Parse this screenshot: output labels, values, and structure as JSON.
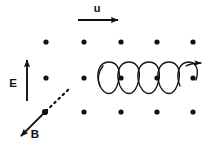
{
  "figure": {
    "background_color": "#ffffff",
    "ink_color": "#111111",
    "width": 211,
    "height": 150
  },
  "labels": {
    "velocity": "u",
    "electric_field": "E",
    "magnetic_field": "B"
  },
  "arrows": {
    "velocity": {
      "name": "u",
      "direction": "right",
      "x1": 78,
      "y1": 20,
      "x2": 121,
      "y2": 20,
      "label_x": 97,
      "label_y": 11,
      "style": "solid"
    },
    "electric_field": {
      "name": "E",
      "direction": "up",
      "x1": 27,
      "y1": 101,
      "x2": 27,
      "y2": 57,
      "label_x": 13,
      "label_y": 85,
      "style": "solid"
    },
    "magnetic_field": {
      "name": "B",
      "direction": "down-left",
      "x1": 45,
      "y1": 112,
      "x2": 19,
      "y2": 138,
      "dashed_x1": 45,
      "dashed_y1": 112,
      "dashed_x2": 70,
      "dashed_y2": 88,
      "label_x": 34,
      "label_y": 137,
      "style": "solid-with-dashed-extension",
      "origin_dot": {
        "x": 45,
        "y": 112,
        "r": 3.1
      }
    }
  },
  "dot_grid": {
    "meaning": "field-out-of-page",
    "radius": 2.6,
    "rows": [
      {
        "name": "top-row",
        "y": 42,
        "x": [
          46,
          84,
          121,
          157,
          193
        ]
      },
      {
        "name": "middle-row",
        "y": 78,
        "x": [
          46,
          84,
          121,
          157,
          193
        ]
      },
      {
        "name": "bottom-row",
        "y": 112,
        "x": [
          84,
          121,
          157,
          193
        ]
      }
    ]
  },
  "helix": {
    "name": "circular-polarization-helix",
    "axis_y": 78,
    "x_start": 100,
    "x_end": 199,
    "loops": 5,
    "loop_width": 20,
    "loop_top": 62,
    "loop_bottom": 96,
    "arrow_tip_x": 203,
    "arrow_tip_y": 63,
    "stroke_width": 1.3
  }
}
